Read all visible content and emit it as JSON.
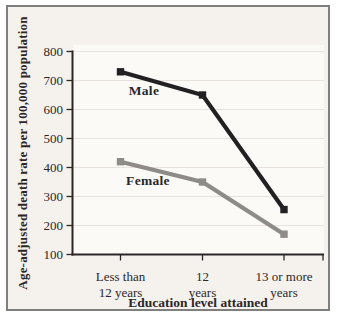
{
  "figure": {
    "background": "#ffffff",
    "panel_bg": "#f5f2ed",
    "plot_bg": "#fbfaf7",
    "frame_border": "#7f7f7f",
    "grid_color": "#e7e2db",
    "axis_color": "#2b2728",
    "text_color": "#2b2728"
  },
  "chart_data": {
    "type": "line",
    "title": "",
    "xlabel": "Education level attained",
    "ylabel": "Age-adjusted death rate per 100,000 population",
    "categories": [
      [
        "Less than",
        "12 years"
      ],
      [
        "12",
        "years"
      ],
      [
        "13 or more",
        "years"
      ]
    ],
    "series": [
      {
        "name": "Male",
        "values": [
          730,
          650,
          255
        ],
        "color": "#232021"
      },
      {
        "name": "Female",
        "values": [
          420,
          350,
          170
        ],
        "color": "#8e8b88"
      }
    ],
    "ylim": [
      100,
      800
    ],
    "yticks": [
      100,
      200,
      300,
      400,
      500,
      600,
      700,
      800
    ],
    "grid": "horizontal-light",
    "marker": "square",
    "legend": "inline-series-labels"
  }
}
